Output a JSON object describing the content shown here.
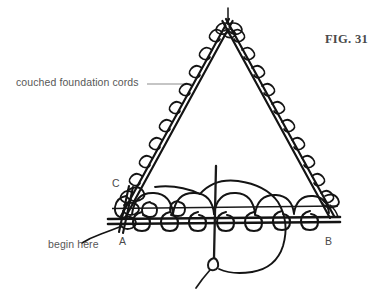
{
  "figure": {
    "caption": "FIG. 31",
    "background_color": "#ffffff",
    "ink_color": "#1a1a1a",
    "label_color": "#575757",
    "leader_color": "#8c8c8c"
  },
  "annotations": {
    "cords_label": "couched foundation cords",
    "begin_label": "begin here"
  },
  "points": {
    "a": "A",
    "b": "B",
    "c": "C"
  },
  "geometry": {
    "apex": {
      "x": 227,
      "y": 18
    },
    "base_left": {
      "x": 118,
      "y": 218
    },
    "base_right": {
      "x": 336,
      "y": 218
    },
    "base_upper_line_y": 208,
    "needle_x": 216,
    "needle_top_y": 166,
    "needle_eye_y": 266,
    "couch_stitch_count_per_leg": 11,
    "base_loop_count": 9
  }
}
